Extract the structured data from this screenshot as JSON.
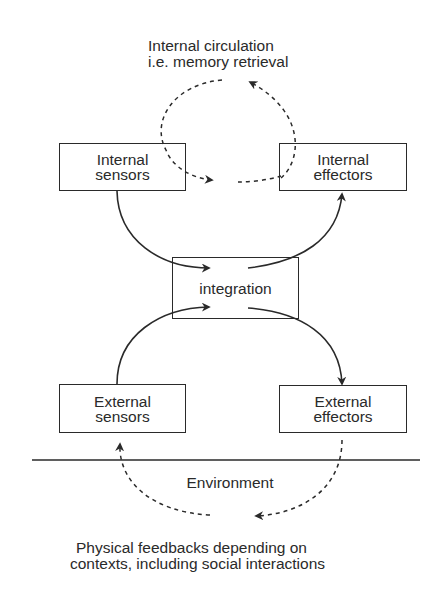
{
  "diagram": {
    "title_top": {
      "line1": "Internal circulation",
      "line2": "i.e. memory retrieval"
    },
    "nodes": {
      "internal_sensors": "Internal\nsensors",
      "internal_effectors": "Internal\neffectors",
      "integration": "integration",
      "external_sensors": "External\nsensors",
      "external_effectors": "External\neffectors"
    },
    "environment_label": "Environment",
    "caption_bottom": {
      "line1": "Physical feedbacks depending on",
      "line2": "contexts, including social interactions"
    },
    "edges": [
      {
        "from": "internal_effectors",
        "to": "internal_sensors",
        "style": "dashed",
        "via": "internal circulation loop"
      },
      {
        "from": "internal_sensors",
        "to": "integration",
        "style": "solid"
      },
      {
        "from": "integration",
        "to": "internal_effectors",
        "style": "solid"
      },
      {
        "from": "external_sensors",
        "to": "integration",
        "style": "solid"
      },
      {
        "from": "integration",
        "to": "external_effectors",
        "style": "solid"
      },
      {
        "from": "external_effectors",
        "to": "external_sensors",
        "style": "dashed",
        "via": "environment"
      }
    ],
    "colors": {
      "stroke": "#2a2a2a",
      "background": "#ffffff"
    }
  }
}
